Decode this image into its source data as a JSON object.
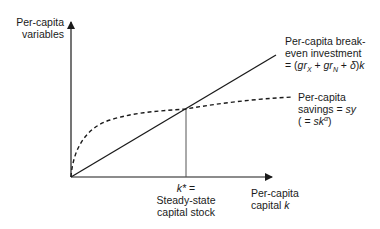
{
  "diagram": {
    "y_axis_label": [
      "Per-capita",
      "variables"
    ],
    "x_axis_label_line1": "Per-capita",
    "x_axis_label_line2_prefix": "capital ",
    "x_axis_label_line2_var": "k",
    "breakeven_label": {
      "line1": "Per-capita break-",
      "line2": "even investment",
      "line3_prefix": "= (",
      "g1": "gr",
      "sub1": "X",
      "plus1": " + ",
      "g2": "gr",
      "sub2": "N",
      "plus2": " + ",
      "delta": "δ",
      "suffix": ")",
      "k": "k"
    },
    "savings_label": {
      "line1": "Per-capita",
      "line2_prefix": "savings = ",
      "line2_var": "sy",
      "line3_prefix": "( = ",
      "line3_var": "sk",
      "line3_sup": "α",
      "line3_suffix": ")"
    },
    "kstar_label": {
      "var": "k*",
      "eq": " =",
      "line2": "Steady-state",
      "line3": "capital stock"
    },
    "colors": {
      "ink": "#1a1a1a",
      "guide": "#555555"
    }
  }
}
